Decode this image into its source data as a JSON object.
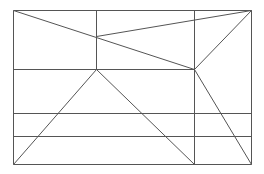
{
  "diagram": {
    "stroke_color": "#555555",
    "background": "#ffffff",
    "lines": [
      {
        "id": "outer-top",
        "x1": 13,
        "y1": 10,
        "x2": 251,
        "y2": 10
      },
      {
        "id": "outer-bottom",
        "x1": 13,
        "y1": 164,
        "x2": 251,
        "y2": 164
      },
      {
        "id": "outer-left",
        "x1": 13,
        "y1": 10,
        "x2": 13,
        "y2": 164
      },
      {
        "id": "outer-right",
        "x1": 251,
        "y1": 10,
        "x2": 251,
        "y2": 164
      },
      {
        "id": "vert-mid-left",
        "x1": 96,
        "y1": 10,
        "x2": 96,
        "y2": 69
      },
      {
        "id": "vert-mid-right",
        "x1": 194,
        "y1": 10,
        "x2": 194,
        "y2": 164
      },
      {
        "id": "horiz-upper",
        "x1": 13,
        "y1": 69,
        "x2": 194,
        "y2": 69
      },
      {
        "id": "horiz-lower-1",
        "x1": 13,
        "y1": 113,
        "x2": 251,
        "y2": 113
      },
      {
        "id": "horiz-lower-2",
        "x1": 13,
        "y1": 136,
        "x2": 251,
        "y2": 136
      },
      {
        "id": "diag-tl-to-b",
        "x1": 13,
        "y1": 10,
        "x2": 194,
        "y2": 69
      },
      {
        "id": "diag-a-to-tr",
        "x1": 96,
        "y1": 36,
        "x2": 251,
        "y2": 10
      },
      {
        "id": "diag-b-to-tr",
        "x1": 194,
        "y1": 69,
        "x2": 251,
        "y2": 10
      },
      {
        "id": "diag-peak-to-bl",
        "x1": 96,
        "y1": 69,
        "x2": 13,
        "y2": 164
      },
      {
        "id": "diag-peak-to-bm",
        "x1": 96,
        "y1": 69,
        "x2": 194,
        "y2": 164
      },
      {
        "id": "diag-b-to-br",
        "x1": 194,
        "y1": 69,
        "x2": 251,
        "y2": 164
      }
    ]
  }
}
